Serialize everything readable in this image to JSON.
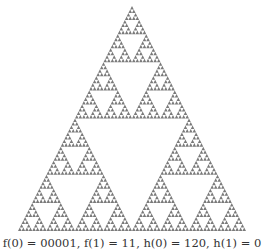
{
  "figure": {
    "type": "sierpinski-triangle",
    "apex": [
      132,
      6
    ],
    "base_left": [
      18,
      231
    ],
    "base_right": [
      246,
      231
    ],
    "depth": 6,
    "fill_color": "#7a7a7a",
    "background": "#ffffff"
  },
  "caption": {
    "text": "f(0) = 00001, f(1) = 11, h(0) = 120, h(1) = 0"
  }
}
